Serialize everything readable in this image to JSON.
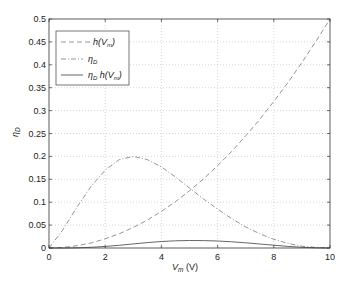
{
  "chart_data": {
    "type": "line",
    "title": "",
    "xlabel": "V_m (V)",
    "ylabel": "η_D",
    "xlim": [
      0,
      10
    ],
    "ylim": [
      0,
      0.5
    ],
    "grid": true,
    "legend_position": "upper left",
    "x_ticks": [
      "0",
      "2",
      "4",
      "6",
      "8",
      "10"
    ],
    "y_ticks": [
      "0",
      "0.05",
      "0.1",
      "0.15",
      "0.2",
      "0.25",
      "0.3",
      "0.35",
      "0.4",
      "0.45",
      "0.5"
    ],
    "x": [
      0,
      0.5,
      1,
      1.5,
      2,
      2.5,
      3,
      3.5,
      4,
      4.5,
      5,
      5.5,
      6,
      6.5,
      7,
      7.5,
      8,
      8.5,
      9,
      9.5,
      10
    ],
    "series": [
      {
        "name": "h(V_m)",
        "style": "dashed",
        "values": [
          0,
          0.001,
          0.005,
          0.011,
          0.02,
          0.031,
          0.045,
          0.061,
          0.08,
          0.101,
          0.125,
          0.151,
          0.18,
          0.211,
          0.245,
          0.281,
          0.32,
          0.361,
          0.405,
          0.451,
          0.5
        ]
      },
      {
        "name": "η_D",
        "style": "dashdot",
        "values": [
          0,
          0.04,
          0.09,
          0.135,
          0.17,
          0.193,
          0.2,
          0.193,
          0.177,
          0.155,
          0.131,
          0.107,
          0.085,
          0.064,
          0.046,
          0.031,
          0.019,
          0.01,
          0.004,
          0.001,
          0
        ]
      },
      {
        "name": "η_D h(V_m)",
        "style": "solid",
        "values": [
          0,
          0,
          0.0005,
          0.0015,
          0.0034,
          0.006,
          0.009,
          0.0118,
          0.0142,
          0.0157,
          0.0164,
          0.0162,
          0.0153,
          0.0135,
          0.0113,
          0.0087,
          0.0061,
          0.0036,
          0.0016,
          0.0005,
          0
        ]
      }
    ]
  },
  "legend": {
    "items": [
      {
        "label_main": "h(V",
        "label_sub": "m",
        "label_end": ")"
      },
      {
        "label_main": "η",
        "label_sub": "D",
        "label_end": ""
      },
      {
        "label_main": "η",
        "label_sub": "D",
        "label_end": " h(V_m)"
      }
    ]
  },
  "axes": {
    "xlabel_main": "V",
    "xlabel_sub": "m",
    "xlabel_unit": " (V)",
    "ylabel_main": "η",
    "ylabel_sub": "D"
  }
}
